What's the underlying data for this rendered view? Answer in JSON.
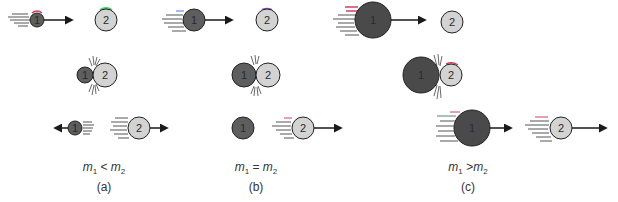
{
  "colors": {
    "ball1_fill": "#5e5e5e",
    "ball1_big_fill": "#4a4a4a",
    "ball2_fill": "#d3d3d3",
    "outline": "#222222",
    "arrow": "#1a1a1a",
    "motion_lines": "#555555",
    "accent_red": "#d04060",
    "accent_green": "#44cc66",
    "accent_blue": "#5577cc",
    "accent_purple": "#9955cc"
  },
  "balls": {
    "ball1_label": "1",
    "ball2_label": "2"
  },
  "panels": [
    {
      "id": "a",
      "letter": "(a)",
      "relation": {
        "lhs": "m",
        "lhs_sub": "1",
        "op": "<",
        "rhs": "m",
        "rhs_sub": "2"
      },
      "stages": [
        "before-collision",
        "collision",
        "after-collision"
      ],
      "description": "Small ball 1 hits heavier ball 2 and bounces back; ball 2 moves forward"
    },
    {
      "id": "b",
      "letter": "(b)",
      "relation": {
        "lhs": "m",
        "lhs_sub": "1",
        "op": "=",
        "rhs": "m",
        "rhs_sub": "2"
      },
      "stages": [
        "before-collision",
        "collision",
        "after-collision"
      ],
      "description": "Equal masses: ball 1 stops, ball 2 moves forward with ball 1's velocity"
    },
    {
      "id": "c",
      "letter": "(c)",
      "relation": {
        "lhs": "m",
        "lhs_sub": "1",
        "op": ">",
        "rhs": "m",
        "rhs_sub": "2"
      },
      "stages": [
        "before-collision",
        "collision",
        "after-collision"
      ],
      "description": "Heavy ball 1 hits lighter ball 2; both move forward, ball 2 faster"
    }
  ]
}
